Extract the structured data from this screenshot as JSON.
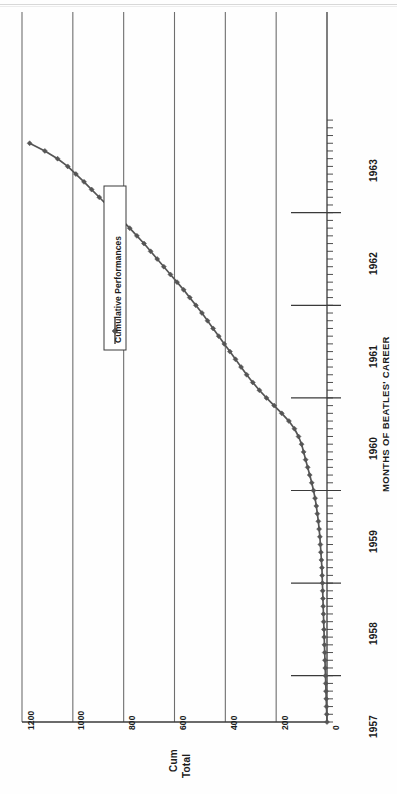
{
  "chart_data": {
    "type": "line",
    "title": "",
    "xlabel": "MONTHS OF BEATLES' CAREER",
    "ylabel": "Cum Total",
    "ylabel_line1": "Cum",
    "ylabel_line2": "Total",
    "orientation": "rotated-90-ccw",
    "grid": true,
    "grid_axis": "y",
    "legend": {
      "position": "inside-left",
      "entries": [
        {
          "label": "Cumulative Performances",
          "marker": "diamond",
          "color": "#555555"
        }
      ]
    },
    "xlim": [
      1957.0,
      1963.5
    ],
    "ylim": [
      0,
      1200
    ],
    "xticks": [
      "1957",
      "1958",
      "1959",
      "1960",
      "1961",
      "1962",
      "1963"
    ],
    "xtick_values": [
      1957,
      1958,
      1959,
      1960,
      1961,
      1962,
      1963
    ],
    "yticks": [
      "0",
      "200",
      "400",
      "600",
      "800",
      "1000",
      "1200"
    ],
    "ytick_values": [
      0,
      200,
      400,
      600,
      800,
      1000,
      1200
    ],
    "minor_tick_interval_months": 1,
    "series": [
      {
        "name": "Cumulative Performances",
        "color": "#555555",
        "marker": "diamond",
        "x": [
          1957.0,
          1957.083,
          1957.167,
          1957.25,
          1957.333,
          1957.417,
          1957.5,
          1957.583,
          1957.667,
          1957.75,
          1957.833,
          1957.917,
          1958.0,
          1958.083,
          1958.167,
          1958.25,
          1958.333,
          1958.417,
          1958.5,
          1958.583,
          1958.667,
          1958.75,
          1958.833,
          1958.917,
          1959.0,
          1959.083,
          1959.167,
          1959.25,
          1959.333,
          1959.417,
          1959.5,
          1959.583,
          1959.667,
          1959.75,
          1959.833,
          1959.917,
          1960.0,
          1960.083,
          1960.167,
          1960.25,
          1960.333,
          1960.417,
          1960.5,
          1960.583,
          1960.667,
          1960.75,
          1960.833,
          1960.917,
          1961.0,
          1961.083,
          1961.167,
          1961.25,
          1961.333,
          1961.417,
          1961.5,
          1961.583,
          1961.667,
          1961.75,
          1961.833,
          1961.917,
          1962.0,
          1962.083,
          1962.167,
          1962.25,
          1962.333,
          1962.417,
          1962.5,
          1962.583,
          1962.667,
          1962.75,
          1962.833,
          1962.917,
          1963.0,
          1963.083,
          1963.167,
          1963.25
        ],
        "values": [
          0,
          1,
          2,
          3,
          4,
          5,
          6,
          7,
          8,
          9,
          10,
          11,
          12,
          13,
          14,
          15,
          16,
          17,
          18,
          19,
          20,
          22,
          24,
          26,
          28,
          31,
          34,
          38,
          42,
          47,
          53,
          60,
          68,
          76,
          84,
          92,
          100,
          112,
          128,
          150,
          178,
          208,
          238,
          266,
          292,
          316,
          338,
          360,
          382,
          404,
          426,
          448,
          470,
          492,
          516,
          540,
          564,
          590,
          616,
          642,
          668,
          694,
          720,
          748,
          776,
          806,
          836,
          866,
          896,
          926,
          956,
          988,
          1020,
          1060,
          1110,
          1170
        ]
      }
    ]
  }
}
